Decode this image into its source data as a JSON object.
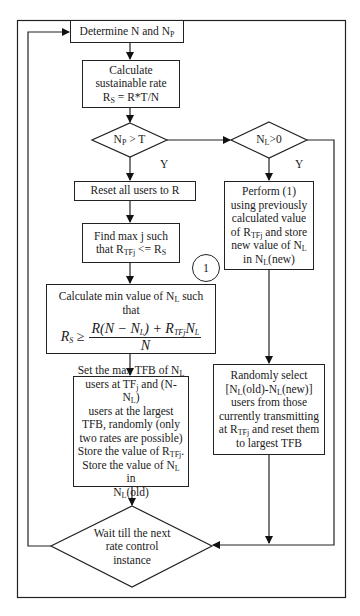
{
  "diagram": {
    "type": "flowchart",
    "nodes": {
      "determine": {
        "text": "Determine N and N",
        "sub": "P"
      },
      "calc_rate": {
        "line1": "Calculate",
        "line2": "sustainable rate",
        "line3_pre": "R",
        "line3_sub": "S",
        "line3_post": " = R*T/N"
      },
      "decision_np": {
        "pre": "N",
        "sub": "P",
        "post": " > T"
      },
      "decision_nl": {
        "pre": "N",
        "sub": "L",
        "post": ">0"
      },
      "reset": {
        "text": "Reset all users to R"
      },
      "find": {
        "line1": "Find max j such",
        "line2_pre": "that R",
        "line2_sub": "TFj",
        "line2_mid": " <= R",
        "line2_sub2": "S"
      },
      "perform": {
        "l1": "Perform (1)",
        "l2": "using previously",
        "l3": "calculated value",
        "l4_pre": "of R",
        "l4_sub": "TFj",
        "l4_post": " and store",
        "l5_pre": "new value of N",
        "l5_sub": "L",
        "l6_pre": "in N",
        "l6_sub": "L",
        "l6_post": "(new)"
      },
      "connector": {
        "text": "1"
      },
      "calc_min": {
        "caption_pre": "Calculate min value of N",
        "caption_sub": "L",
        "caption_post": " such that",
        "formula_lhs": "R",
        "formula_lhs_sub": "S",
        "formula_op": " ≥",
        "formula_num": "R(N − N",
        "formula_num_sub": "L",
        "formula_num_mid": ") + R",
        "formula_num_sub2": "TFj",
        "formula_num_end": "N",
        "formula_num_sub3": "L",
        "formula_den": "N"
      },
      "set_max": {
        "l1_pre": "Set the max TFB of N",
        "l1_sub": "L",
        "l2_pre": "users at TF",
        "l2_sub": "j",
        "l2_mid": " and (N-N",
        "l2_sub2": "L",
        "l2_post": ")",
        "l3": "users at the largest",
        "l4": "TFB, randomly (only",
        "l5": "two rates are possible)",
        "l6_pre": "Store the value of R",
        "l6_sub": "TFj",
        "l6_post": ".",
        "l7_pre": "Store the value of N",
        "l7_sub": "L",
        "l7_post": " in",
        "l8_pre": "N",
        "l8_sub": "L",
        "l8_post": "(old)"
      },
      "random_select": {
        "l1": "Randomly select",
        "l2_a": "[N",
        "l2_s1": "L",
        "l2_b": "(old)-N",
        "l2_s2": "L",
        "l2_c": "(new)]",
        "l3": "users from those",
        "l4": "currently transmitting",
        "l5_pre": "at R",
        "l5_sub": "TFj",
        "l5_post": " and reset them",
        "l6": "to largest TFB"
      },
      "wait": {
        "l1": "Wait till the next",
        "l2": "rate control",
        "l3": "instance"
      }
    },
    "edge_labels": {
      "yes_left": "Y",
      "yes_right": "Y"
    }
  }
}
